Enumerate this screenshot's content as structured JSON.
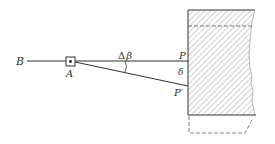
{
  "diagram": {
    "labels": {
      "B": "B",
      "A": "A",
      "P": "P",
      "P_prime": "P′",
      "delta": "δ",
      "delta_beta_symbol": "Δ",
      "delta_beta_beta": "β"
    },
    "colors": {
      "line": "#333333",
      "hatch": "#8a8a8a",
      "dashed": "#555555",
      "background": "#ffffff"
    }
  }
}
